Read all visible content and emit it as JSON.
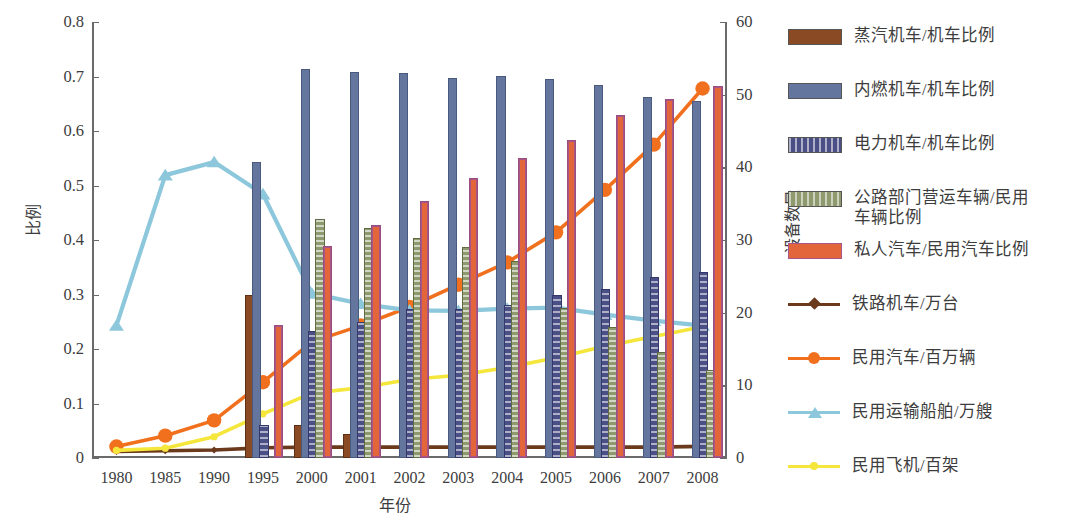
{
  "chart_data": {
    "type": "bar",
    "title": "",
    "xlabel": "年份",
    "ylabel": "比例",
    "ylabel_secondary": "设备数量",
    "categories": [
      "1980",
      "1985",
      "1990",
      "1995",
      "2000",
      "2001",
      "2002",
      "2003",
      "2004",
      "2005",
      "2006",
      "2007",
      "2008"
    ],
    "ylim": [
      0,
      0.8
    ],
    "yticks": [
      "0",
      "0.1",
      "0.2",
      "0.3",
      "0.4",
      "0.5",
      "0.6",
      "0.7",
      "0.8"
    ],
    "ylim_secondary": [
      0,
      60
    ],
    "yticks_secondary": [
      "0",
      "10",
      "20",
      "30",
      "40",
      "50",
      "60"
    ],
    "grid": false,
    "legend_position": "right",
    "bar_series": [
      {
        "name": "蒸汽机车/机车比例",
        "axis": "left",
        "color": "#8a4a23",
        "values": [
          0.0,
          0.0,
          0.0,
          0.295,
          0.057,
          0.04,
          0.0,
          0.0,
          0.0,
          0.0,
          0.0,
          0.0,
          0.0
        ]
      },
      {
        "name": "内燃机车/机车比例",
        "axis": "left",
        "color": "#64769e",
        "values": [
          0.0,
          0.0,
          0.0,
          0.54,
          0.71,
          0.705,
          0.702,
          0.693,
          0.697,
          0.691,
          0.681,
          0.659,
          0.651
        ]
      },
      {
        "name": "电力机车/机车比例",
        "axis": "left",
        "color": "#4a4f86",
        "values": [
          0.0,
          0.0,
          0.0,
          0.057,
          0.23,
          0.245,
          0.27,
          0.27,
          0.277,
          0.295,
          0.307,
          0.329,
          0.337
        ]
      },
      {
        "name": "公路部门营运车辆/民用车辆比例",
        "axis": "left",
        "color": "#8e9a6e",
        "values": [
          0.0,
          0.0,
          0.0,
          0.0,
          0.435,
          0.418,
          0.4,
          0.383,
          0.357,
          0.272,
          0.237,
          0.19,
          0.158
        ]
      },
      {
        "name": "私人汽车/民用汽车比例",
        "axis": "left",
        "color": "#e2663a",
        "values": [
          0.0,
          0.0,
          0.0,
          0.24,
          0.385,
          0.423,
          0.468,
          0.511,
          0.546,
          0.579,
          0.626,
          0.655,
          0.679
        ]
      }
    ],
    "line_series": [
      {
        "name": "铁路机车/万台",
        "axis": "right",
        "color": "#6b3a1c",
        "marker": "diamond",
        "values": [
          0.9,
          1.0,
          1.1,
          1.4,
          1.5,
          1.5,
          1.5,
          1.5,
          1.5,
          1.5,
          1.5,
          1.5,
          1.6
        ]
      },
      {
        "name": "民用汽车/百万辆",
        "axis": "left",
        "color": "#f0701e",
        "marker": "circle",
        "values": [
          0.021,
          0.041,
          0.069,
          0.139,
          0.213,
          0.243,
          0.277,
          0.318,
          0.359,
          0.414,
          0.492,
          0.575,
          0.678
        ]
      },
      {
        "name": "民用运输船舶/万艘",
        "axis": "left",
        "color": "#8dc7db",
        "marker": "triangle",
        "values": [
          0.243,
          0.519,
          0.543,
          0.484,
          0.302,
          0.283,
          0.271,
          0.27,
          0.274,
          0.276,
          0.263,
          0.252,
          0.243
        ]
      },
      {
        "name": "民用飞机/百架",
        "axis": "left",
        "color": "#f5e63c",
        "marker": "circle-small",
        "values": [
          0.014,
          0.018,
          0.039,
          0.081,
          0.119,
          0.129,
          0.144,
          0.152,
          0.166,
          0.184,
          0.205,
          0.223,
          0.241
        ]
      }
    ]
  },
  "legend": {
    "items": [
      {
        "label": "蒸汽机车/机车比例",
        "kind": "bar",
        "color": "#8a4a23"
      },
      {
        "label": "内燃机车/机车比例",
        "kind": "bar",
        "color": "#64769e"
      },
      {
        "label": "电力机车/机车比例",
        "kind": "bar",
        "color": "#4a4f86"
      },
      {
        "label": "公路部门营运车辆/民用\n车辆比例",
        "kind": "bar",
        "color": "#8e9a6e"
      },
      {
        "label": "私人汽车/民用汽车比例",
        "kind": "bar",
        "color": "#e2663a"
      },
      {
        "label": "铁路机车/万台",
        "kind": "line",
        "color": "#6b3a1c",
        "marker": "diamond"
      },
      {
        "label": "民用汽车/百万辆",
        "kind": "line",
        "color": "#f0701e",
        "marker": "circle"
      },
      {
        "label": "民用运输船舶/万艘",
        "kind": "line",
        "color": "#8dc7db",
        "marker": "triangle"
      },
      {
        "label": "民用飞机/百架",
        "kind": "line",
        "color": "#f5e63c",
        "marker": "circle-small"
      }
    ]
  }
}
